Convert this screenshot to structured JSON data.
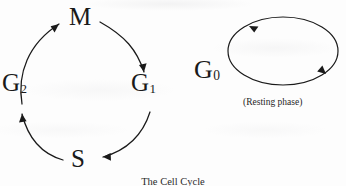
{
  "figure": {
    "caption": "The Cell Cycle",
    "background_color": "#fdfdfd",
    "ink_color": "#1a1a1a"
  },
  "cycle": {
    "name": "cell-cycle-ring",
    "phases": [
      {
        "id": "M",
        "label": "M",
        "subscript": "",
        "position": "top"
      },
      {
        "id": "G1",
        "label": "G",
        "subscript": "1",
        "position": "right"
      },
      {
        "id": "S",
        "label": "S",
        "subscript": "",
        "position": "bottom"
      },
      {
        "id": "G2",
        "label": "G",
        "subscript": "2",
        "position": "left"
      }
    ],
    "arrows": [
      {
        "from": "M",
        "to": "G1",
        "direction": "clockwise"
      },
      {
        "from": "G1",
        "to": "S",
        "direction": "clockwise"
      },
      {
        "from": "S",
        "to": "G2",
        "direction": "clockwise"
      },
      {
        "from": "G2",
        "to": "M",
        "direction": "clockwise"
      }
    ]
  },
  "resting": {
    "name": "g0-resting-loop",
    "label": "G",
    "subscript": "0",
    "caption": "(Resting phase)",
    "loop_arrowheads": 2
  }
}
